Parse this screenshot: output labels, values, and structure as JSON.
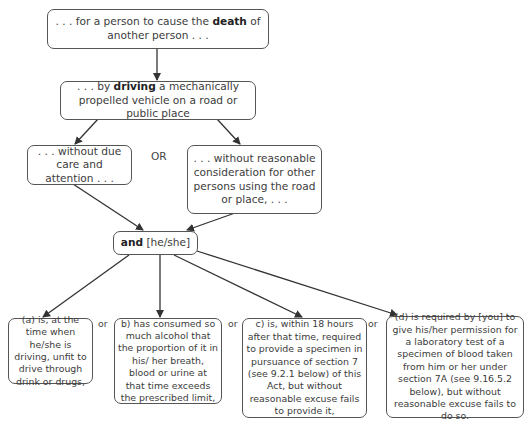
{
  "nodes": {
    "death": {
      "pre": ". . . for a person to cause the ",
      "bold": "death",
      "post": " of another person . . ."
    },
    "driving": {
      "pre": ". . . by ",
      "bold": "driving",
      "post": " a mechanically propelled vehicle on a road or public place"
    },
    "due_care": {
      "text": ". . . without due care and attention . . ."
    },
    "consideration": {
      "text": ". . . without reasonable consideration for other persons using the road or place, . . ."
    },
    "and": {
      "bold": "and",
      "post": " [he/she]"
    },
    "a": {
      "text": "(a) is, at the time when he/she is driving, unfit to drive through drink or drugs,"
    },
    "b": {
      "text": "b) has consumed so much alcohol that the proportion of it in his/ her breath, blood or urine at that time exceeds the prescribed limit,"
    },
    "c": {
      "text": "c) is, within 18 hours after that time, required to provide a  specimen in pursuance of section 7 (see 9.2.1 below) of this Act, but without reasonable excuse fails to provide it,"
    },
    "d": {
      "text": "(d) is required by [you] to give his/her permission for a laboratory test of a specimen of blood taken from him or her under section 7A (see 9.16.5.2 below), but without reasonable excuse fails to do so."
    }
  },
  "labels": {
    "or_upper": "OR",
    "or_ab": "or",
    "or_bc": "or",
    "or_cd": "or"
  },
  "colors": {
    "line": "#333333",
    "border": "#555555",
    "text": "#3c3c3c"
  }
}
